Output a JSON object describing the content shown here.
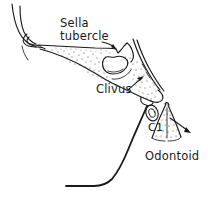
{
  "figure": {
    "background_color": "#ffffff",
    "ink_color": "#1a1a1a",
    "width": 208,
    "height": 197
  },
  "labels": [
    {
      "id": "sella-tubercle",
      "line1": "Sella",
      "line2": "tubercle",
      "x": 60,
      "y": 27,
      "has_leader": true,
      "leader_target": "tuberculum sellae"
    },
    {
      "id": "clivus",
      "line1": "Clivus",
      "line2": "",
      "x": 96,
      "y": 93,
      "has_leader": true,
      "leader_target": "clivus bone"
    },
    {
      "id": "c1",
      "line1": "C1",
      "line2": "",
      "x": 148,
      "y": 131,
      "has_leader": false,
      "leader_target": "anterior arch of C1"
    },
    {
      "id": "odontoid",
      "line1": "Odontoid",
      "line2": "",
      "x": 145,
      "y": 160,
      "has_leader": true,
      "leader_target": "odontoid process"
    }
  ],
  "structures": [
    {
      "id": "facial-profile",
      "name": "Facial profile and nasal outline"
    },
    {
      "id": "skull-base",
      "name": "Anterior skull base / planum sphenoidale"
    },
    {
      "id": "sella-turcica",
      "name": "Sella turcica cavity"
    },
    {
      "id": "dorsum-sellae",
      "name": "Dorsum sellae and posterior clinoid"
    },
    {
      "id": "clivus-body",
      "name": "Clivus"
    },
    {
      "id": "c1-arch",
      "name": "Anterior arch of C1"
    },
    {
      "id": "odontoid-process",
      "name": "Odontoid process (dens)"
    },
    {
      "id": "pharyngeal-wall",
      "name": "Posterior pharyngeal wall"
    }
  ],
  "annotations": {
    "arrow_count": 3,
    "stipple_regions": [
      "skull base marrow",
      "clivus",
      "odontoid process"
    ]
  }
}
